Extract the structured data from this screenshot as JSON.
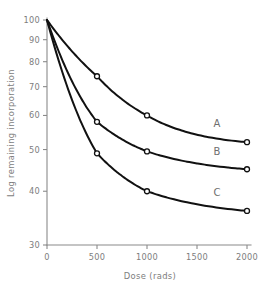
{
  "chart_data": {
    "type": "line",
    "title": "",
    "xlabel": "Dose (rads)",
    "ylabel": "Log remaining incorporation",
    "yscale": "log",
    "xscale": "linear",
    "xlim": [
      0,
      2000
    ],
    "ylim": [
      30,
      100
    ],
    "grid": false,
    "legend_position": "inline-right",
    "x_ticks": [
      0,
      500,
      1000,
      1500,
      2000
    ],
    "x_tick_labels": [
      "0",
      "500",
      "1000",
      "1500",
      "2000"
    ],
    "y_ticks": [
      30,
      40,
      50,
      60,
      70,
      80,
      90,
      100
    ],
    "y_tick_labels": [
      "30",
      "40",
      "50",
      "60",
      "70",
      "80",
      "90",
      "100"
    ],
    "marker": "open-circle",
    "x": [
      0,
      500,
      1000,
      2000
    ],
    "series": [
      {
        "name": "A",
        "label": "A",
        "values": [
          100,
          74,
          60,
          52
        ],
        "color": "#111111"
      },
      {
        "name": "B",
        "label": "B",
        "values": [
          100,
          58,
          49.5,
          45
        ],
        "color": "#111111"
      },
      {
        "name": "C",
        "label": "C",
        "values": [
          100,
          49,
          40,
          36
        ],
        "color": "#111111"
      }
    ],
    "annotations": [
      {
        "text": "A",
        "series": "A",
        "x": 1700,
        "y": 56.5
      },
      {
        "text": "B",
        "series": "B",
        "x": 1700,
        "y": 48.5
      },
      {
        "text": "C",
        "series": "C",
        "x": 1700,
        "y": 39.0
      }
    ]
  }
}
